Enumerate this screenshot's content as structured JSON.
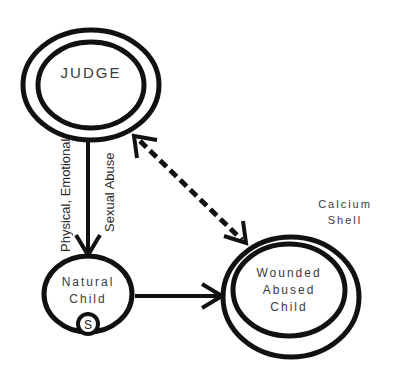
{
  "diagram": {
    "nodes": {
      "judge": {
        "label": "JUDGE"
      },
      "natural_child": {
        "line1": "Natural",
        "line2": "Child",
        "badge": "S"
      },
      "wounded_child": {
        "line1": "Wounded",
        "line2": "Abused",
        "line3": "Child"
      }
    },
    "annotations": {
      "calcium_shell_line1": "Calcium",
      "calcium_shell_line2": "Shell"
    },
    "edges": [
      {
        "from": "JUDGE",
        "to": "Natural Child",
        "style": "solid",
        "label1": "Physical, Emotional",
        "label2": "Sexual Abuse"
      },
      {
        "from": "Natural Child",
        "to": "Wounded Abused Child",
        "style": "solid"
      },
      {
        "from": "JUDGE",
        "to": "Wounded Abused Child",
        "style": "dashed",
        "bidirectional": true
      }
    ],
    "colors": {
      "stroke": "#111111",
      "text": "#3a3a3a",
      "background": "#ffffff"
    }
  }
}
